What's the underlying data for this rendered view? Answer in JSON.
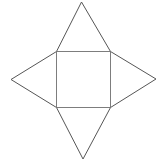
{
  "figure": {
    "name": "square-with-four-triangles-net",
    "canvas": {
      "width": 162,
      "height": 167,
      "background_color": "#ffffff"
    },
    "style": {
      "square_stroke_color": "#7d7d7d",
      "triangle_stroke_color": "#565656",
      "stroke_width": 1,
      "fill": "none"
    },
    "geometry": {
      "square": {
        "label": "central-square",
        "points": "56.5,51.5 110.5,51.5 110.5,107.5 56.5,107.5",
        "corners": {
          "top_left": [
            56.5,
            51.5
          ],
          "top_right": [
            110.5,
            51.5
          ],
          "bottom_right": [
            110.5,
            107.5
          ],
          "bottom_left": [
            56.5,
            107.5
          ]
        },
        "side_length": 55
      },
      "triangles": [
        {
          "label": "top-triangle",
          "apex": [
            81.5,
            2.0
          ],
          "base_start": [
            56.5,
            51.5
          ],
          "base_end": [
            110.5,
            51.5
          ],
          "points": "56.5,51.5 81.5,2.0 110.5,51.5"
        },
        {
          "label": "right-triangle",
          "apex": [
            156.0,
            79.0
          ],
          "base_start": [
            110.5,
            51.5
          ],
          "base_end": [
            110.5,
            107.5
          ],
          "points": "110.5,51.5 156.0,79.0 110.5,107.5"
        },
        {
          "label": "bottom-triangle",
          "apex": [
            83.0,
            159.0
          ],
          "base_start": [
            110.5,
            107.5
          ],
          "base_end": [
            56.5,
            107.5
          ],
          "points": "110.5,107.5 83.0,159.0 56.5,107.5"
        },
        {
          "label": "left-triangle",
          "apex": [
            11.0,
            79.5
          ],
          "base_start": [
            56.5,
            107.5
          ],
          "base_end": [
            56.5,
            51.5
          ],
          "points": "56.5,107.5 11.0,79.5 56.5,51.5"
        }
      ]
    }
  }
}
